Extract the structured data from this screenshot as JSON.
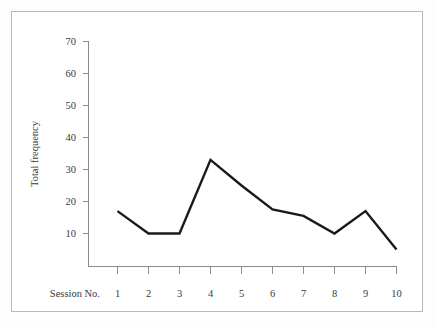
{
  "chart_data": {
    "type": "line",
    "title": "",
    "xlabel": "Session No.",
    "ylabel": "Total frequency",
    "categories": [
      "1",
      "2",
      "3",
      "4",
      "5",
      "6",
      "7",
      "8",
      "9",
      "10"
    ],
    "x": [
      1,
      2,
      3,
      4,
      5,
      6,
      7,
      8,
      9,
      10
    ],
    "values": [
      17,
      10,
      10,
      33,
      25,
      17.5,
      15.5,
      10,
      17,
      5
    ],
    "series": [
      {
        "name": "Total frequency",
        "values": [
          17,
          10,
          10,
          33,
          25,
          17.5,
          15.5,
          10,
          17,
          5
        ]
      }
    ],
    "ylim": [
      0,
      70
    ],
    "xlim": [
      1,
      10
    ],
    "ytick_labels": [
      "10",
      "20",
      "30",
      "40",
      "50",
      "60",
      "70"
    ],
    "ytick_values": [
      10,
      20,
      30,
      40,
      50,
      60,
      70
    ],
    "xtick_labels": [
      "1",
      "2",
      "3",
      "4",
      "5",
      "6",
      "7",
      "8",
      "9",
      "10"
    ],
    "grid": false,
    "legend": "none",
    "line_color": "#1a1a1a",
    "axis_color": "#8c8c8c",
    "frame_color": "#b9b9b9",
    "background_color": "#ffffff"
  }
}
